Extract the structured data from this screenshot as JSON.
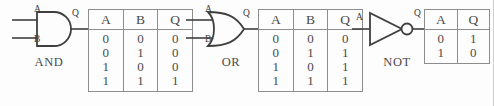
{
  "diagram": {
    "stroke_color": "#3f3f3f",
    "table_border_color": "#8d8d8d",
    "background": "#fdfdfd"
  },
  "gates": [
    {
      "id": "and",
      "name": "AND",
      "shape": "and-gate-icon",
      "inputs": [
        {
          "label": "A",
          "name": "input-pin-a"
        },
        {
          "label": "B",
          "name": "input-pin-b"
        }
      ],
      "output": {
        "label": "Q",
        "name": "output-pin-q"
      },
      "truth_table": {
        "columns": [
          "A",
          "B",
          "Q"
        ],
        "rows": [
          [
            "0",
            "0",
            "0"
          ],
          [
            "0",
            "1",
            "0"
          ],
          [
            "1",
            "0",
            "0"
          ],
          [
            "1",
            "1",
            "1"
          ]
        ],
        "col_A": [
          "0",
          "0",
          "1",
          "1"
        ],
        "col_B": [
          "0",
          "1",
          "0",
          "1"
        ],
        "col_Q": [
          "0",
          "0",
          "0",
          "1"
        ]
      }
    },
    {
      "id": "or",
      "name": "OR",
      "shape": "or-gate-icon",
      "inputs": [
        {
          "label": "A",
          "name": "input-pin-a"
        },
        {
          "label": "B",
          "name": "input-pin-b"
        }
      ],
      "output": {
        "label": "Q",
        "name": "output-pin-q"
      },
      "truth_table": {
        "columns": [
          "A",
          "B",
          "Q"
        ],
        "rows": [
          [
            "0",
            "0",
            "0"
          ],
          [
            "0",
            "1",
            "1"
          ],
          [
            "1",
            "0",
            "1"
          ],
          [
            "1",
            "1",
            "1"
          ]
        ],
        "col_A": [
          "0",
          "0",
          "1",
          "1"
        ],
        "col_B": [
          "0",
          "1",
          "0",
          "1"
        ],
        "col_Q": [
          "0",
          "1",
          "1",
          "1"
        ]
      }
    },
    {
      "id": "not",
      "name": "NOT",
      "shape": "not-gate-icon",
      "inputs": [
        {
          "label": "A",
          "name": "input-pin-a"
        }
      ],
      "output": {
        "label": "Q",
        "name": "output-pin-q"
      },
      "truth_table": {
        "columns": [
          "A",
          "Q"
        ],
        "rows": [
          [
            "0",
            "1"
          ],
          [
            "1",
            "0"
          ]
        ],
        "col_A": [
          "0",
          "1"
        ],
        "col_Q": [
          "1",
          "0"
        ]
      }
    }
  ]
}
